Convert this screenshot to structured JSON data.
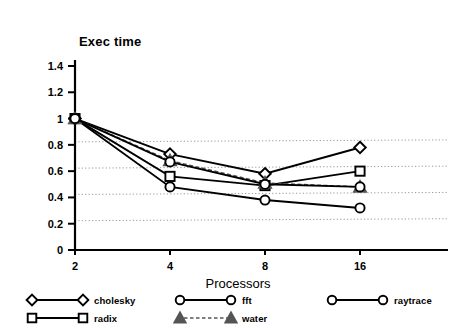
{
  "chart_data": {
    "type": "line",
    "title": "",
    "ylabel": "Exec time",
    "xlabel": "Processors",
    "categories": [
      "2",
      "4",
      "8",
      "16"
    ],
    "ylim": [
      0,
      1.5
    ],
    "yticks": [
      "0",
      "0.2",
      "0.4",
      "0.6",
      "0.8",
      "1",
      "1.2",
      "1.4"
    ],
    "ytick_values": [
      0,
      0.2,
      0.4,
      0.6,
      0.8,
      1,
      1.2,
      1.4
    ],
    "grid": "horizontal-dotted",
    "legend_position": "below",
    "series": [
      {
        "name": "cholesky",
        "marker": "diamond",
        "linestyle": "solid",
        "color": "#000000",
        "values": [
          1.0,
          0.73,
          0.58,
          0.78
        ]
      },
      {
        "name": "radix",
        "marker": "square",
        "linestyle": "solid",
        "color": "#000000",
        "values": [
          1.0,
          0.56,
          0.49,
          0.6
        ]
      },
      {
        "name": "fft",
        "marker": "circle",
        "linestyle": "solid",
        "color": "#000000",
        "values": [
          1.0,
          0.48,
          0.38,
          0.32
        ]
      },
      {
        "name": "water",
        "marker": "triangle",
        "linestyle": "dashed",
        "color": "#555555",
        "values": [
          1.0,
          0.68,
          0.51,
          0.48
        ]
      },
      {
        "name": "raytrace",
        "marker": "circle",
        "linestyle": "solid",
        "color": "#000000",
        "values": [
          1.0,
          0.67,
          0.5,
          0.48
        ]
      }
    ]
  },
  "axis": {
    "y_title": "Exec time",
    "x_title": "Processors",
    "y_ticks": [
      "1.4",
      "1.2",
      "1",
      "0.8",
      "0.6",
      "0.4",
      "0.2",
      "0"
    ],
    "x_ticks": [
      "2",
      "4",
      "8",
      "16"
    ]
  },
  "legend": {
    "items": [
      {
        "label": "cholesky",
        "marker": "diamond",
        "style": "solid"
      },
      {
        "label": "fft",
        "marker": "circle",
        "style": "solid"
      },
      {
        "label": "raytrace",
        "marker": "circle",
        "style": "solid"
      },
      {
        "label": "radix",
        "marker": "square",
        "style": "solid"
      },
      {
        "label": "water",
        "marker": "triangle",
        "style": "dashed"
      }
    ]
  },
  "colors": {
    "axis": "#000000",
    "grid": "#8c8c8c",
    "series_dark": "#000000",
    "series_gray": "#555555",
    "background": "#ffffff"
  }
}
